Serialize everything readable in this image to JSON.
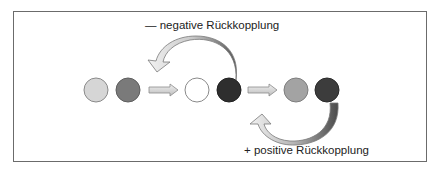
{
  "diagram": {
    "negative_label": "— negative Rückkopplung",
    "positive_label": "+ positive Rückkopplung",
    "circles": [
      {
        "fill": "#d6d6d6",
        "stroke": "#8a8a8a"
      },
      {
        "fill": "#7a7a7a",
        "stroke": "#5e5e5e"
      },
      {
        "fill": "#ffffff",
        "stroke": "#8a8a8a"
      },
      {
        "fill": "#2e2e2e",
        "stroke": "#222222"
      },
      {
        "fill": "#a3a3a3",
        "stroke": "#7e7e7e"
      },
      {
        "fill": "#3c3c3c",
        "stroke": "#2a2a2a"
      }
    ]
  }
}
